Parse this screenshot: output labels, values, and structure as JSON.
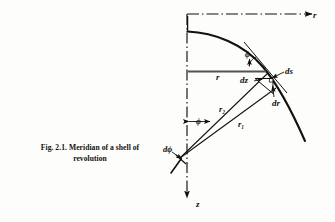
{
  "figure": {
    "caption_line1": "Fig. 2.1. Meridian of a shell of",
    "caption_line2": "revolution",
    "caption_full": "Fig. 2.1. Meridian of a shell of revolution"
  },
  "axes": {
    "horizontal_label": "r",
    "vertical_label": "z",
    "horizontal_style": "dash-dot",
    "vertical_style": "dash-dot",
    "horizontal_direction": "right",
    "vertical_direction": "down"
  },
  "labels": {
    "radius_r": "r",
    "arc_ds": "ds",
    "axial_dz": "dz",
    "radial_dr": "dr",
    "meridional_radius": "r₂",
    "circumferential_radius": "r₁",
    "angle_phi_tangent": "ϕ",
    "angle_phi_axis": "ϕ",
    "angle_dphi": "dϕ"
  },
  "colors": {
    "ink": "#13110f",
    "paper": "#fdfdfb",
    "rule": "#6e6e68"
  }
}
